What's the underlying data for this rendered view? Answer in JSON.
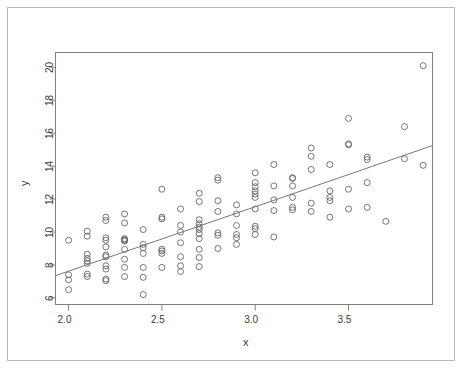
{
  "figure": {
    "background_color": "#ffffff",
    "outer_frame_color": "#b9b9b9",
    "axis_color": "#808080",
    "point_color": "#666666",
    "line_color": "#777777",
    "text_color": "#3a3a3a"
  },
  "chart_data": {
    "type": "scatter",
    "title": "",
    "xlabel": "x",
    "ylabel": "y",
    "xlim": [
      1.93,
      3.95
    ],
    "ylim": [
      5.6,
      20.9
    ],
    "xticks": [
      2.0,
      2.5,
      3.0,
      3.5
    ],
    "xtick_labels": [
      "2.0",
      "2.5",
      "3.0",
      "3.5"
    ],
    "yticks": [
      6,
      8,
      10,
      12,
      14,
      16,
      18,
      20
    ],
    "ytick_labels": [
      "6",
      "8",
      "10",
      "12",
      "14",
      "16",
      "18",
      "20"
    ],
    "grid": false,
    "legend": null,
    "marker": "open-circle",
    "marker_size": 3,
    "fit_line": {
      "type": "linear-regression",
      "x_start": 1.93,
      "y_start": 7.35,
      "x_end": 3.95,
      "y_end": 15.25,
      "slope": 3.91,
      "intercept": -0.19
    },
    "points": [
      [
        2.0,
        9.5
      ],
      [
        2.0,
        7.4
      ],
      [
        2.0,
        7.1
      ],
      [
        2.0,
        6.5
      ],
      [
        2.1,
        10.05
      ],
      [
        2.1,
        9.75
      ],
      [
        2.1,
        8.65
      ],
      [
        2.1,
        8.4
      ],
      [
        2.1,
        8.25
      ],
      [
        2.1,
        8.1
      ],
      [
        2.1,
        7.45
      ],
      [
        2.1,
        7.3
      ],
      [
        2.2,
        10.9
      ],
      [
        2.2,
        10.7
      ],
      [
        2.2,
        9.65
      ],
      [
        2.2,
        9.5
      ],
      [
        2.2,
        9.1
      ],
      [
        2.2,
        8.6
      ],
      [
        2.2,
        8.5
      ],
      [
        2.2,
        7.95
      ],
      [
        2.2,
        7.75
      ],
      [
        2.2,
        7.15
      ],
      [
        2.2,
        7.05
      ],
      [
        2.3,
        11.1
      ],
      [
        2.3,
        10.55
      ],
      [
        2.3,
        9.6
      ],
      [
        2.3,
        9.55
      ],
      [
        2.3,
        9.5
      ],
      [
        2.3,
        9.45
      ],
      [
        2.3,
        8.95
      ],
      [
        2.3,
        8.35
      ],
      [
        2.3,
        7.85
      ],
      [
        2.3,
        7.3
      ],
      [
        2.4,
        10.15
      ],
      [
        2.4,
        9.25
      ],
      [
        2.4,
        9.05
      ],
      [
        2.4,
        8.7
      ],
      [
        2.4,
        7.85
      ],
      [
        2.4,
        7.25
      ],
      [
        2.4,
        6.2
      ],
      [
        2.5,
        12.6
      ],
      [
        2.5,
        10.9
      ],
      [
        2.5,
        10.8
      ],
      [
        2.5,
        8.95
      ],
      [
        2.5,
        8.85
      ],
      [
        2.5,
        8.7
      ],
      [
        2.5,
        7.85
      ],
      [
        2.6,
        11.4
      ],
      [
        2.6,
        10.4
      ],
      [
        2.6,
        10.0
      ],
      [
        2.6,
        9.35
      ],
      [
        2.6,
        8.5
      ],
      [
        2.6,
        7.95
      ],
      [
        2.6,
        7.6
      ],
      [
        2.7,
        12.35
      ],
      [
        2.7,
        11.85
      ],
      [
        2.7,
        10.75
      ],
      [
        2.7,
        10.5
      ],
      [
        2.7,
        10.3
      ],
      [
        2.7,
        10.15
      ],
      [
        2.7,
        9.9
      ],
      [
        2.7,
        9.6
      ],
      [
        2.7,
        8.95
      ],
      [
        2.7,
        8.45
      ],
      [
        2.7,
        7.9
      ],
      [
        2.8,
        13.3
      ],
      [
        2.8,
        13.15
      ],
      [
        2.8,
        11.9
      ],
      [
        2.8,
        11.25
      ],
      [
        2.8,
        9.95
      ],
      [
        2.8,
        9.8
      ],
      [
        2.8,
        9.0
      ],
      [
        2.9,
        11.65
      ],
      [
        2.9,
        11.1
      ],
      [
        2.9,
        10.4
      ],
      [
        2.9,
        9.85
      ],
      [
        2.9,
        9.65
      ],
      [
        2.9,
        9.25
      ],
      [
        3.0,
        13.6
      ],
      [
        3.0,
        13.0
      ],
      [
        3.0,
        12.75
      ],
      [
        3.0,
        12.5
      ],
      [
        3.0,
        12.3
      ],
      [
        3.0,
        12.1
      ],
      [
        3.0,
        11.4
      ],
      [
        3.0,
        10.35
      ],
      [
        3.0,
        10.2
      ],
      [
        3.0,
        9.85
      ],
      [
        3.1,
        14.1
      ],
      [
        3.1,
        12.8
      ],
      [
        3.1,
        11.95
      ],
      [
        3.1,
        11.3
      ],
      [
        3.1,
        9.7
      ],
      [
        3.2,
        13.3
      ],
      [
        3.2,
        13.25
      ],
      [
        3.2,
        12.8
      ],
      [
        3.2,
        12.1
      ],
      [
        3.2,
        11.5
      ],
      [
        3.2,
        11.35
      ],
      [
        3.3,
        15.1
      ],
      [
        3.3,
        14.6
      ],
      [
        3.3,
        13.8
      ],
      [
        3.3,
        11.75
      ],
      [
        3.3,
        11.25
      ],
      [
        3.4,
        14.1
      ],
      [
        3.4,
        12.5
      ],
      [
        3.4,
        12.1
      ],
      [
        3.4,
        11.9
      ],
      [
        3.4,
        10.9
      ],
      [
        3.5,
        16.9
      ],
      [
        3.5,
        15.35
      ],
      [
        3.5,
        15.3
      ],
      [
        3.5,
        12.6
      ],
      [
        3.5,
        11.4
      ],
      [
        3.6,
        14.55
      ],
      [
        3.6,
        14.4
      ],
      [
        3.6,
        13.0
      ],
      [
        3.6,
        11.5
      ],
      [
        3.7,
        10.65
      ],
      [
        3.8,
        16.4
      ],
      [
        3.8,
        14.45
      ],
      [
        3.9,
        20.1
      ],
      [
        3.9,
        14.05
      ]
    ]
  }
}
